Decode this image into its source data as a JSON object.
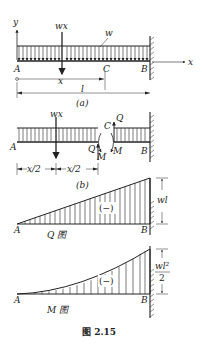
{
  "figure": {
    "caption": "图 2.15",
    "panel_a": {
      "label": "(a)",
      "axis_y": "y",
      "axis_x": "x",
      "load_label": "w",
      "resultant_label": "wx",
      "point_A": "A",
      "point_B": "B",
      "point_C": "C",
      "dim_x": "x",
      "dim_l": "l"
    },
    "panel_b": {
      "label": "(b)",
      "resultant_label": "wx",
      "point_A": "A",
      "point_B": "B",
      "point_C": "C",
      "shear_left": "Q",
      "shear_right": "Q",
      "moment_left": "M",
      "moment_right": "M",
      "dim_half1": "x/2",
      "dim_half2": "x/2"
    },
    "shear_diagram": {
      "title": "Q 图",
      "point_A": "A",
      "point_B": "B",
      "sign": "(−)",
      "max_label": "wl"
    },
    "moment_diagram": {
      "title": "M 图",
      "point_A": "A",
      "point_B": "B",
      "sign": "(−)",
      "max_label_num": "wl²",
      "max_label_den": "2"
    }
  }
}
